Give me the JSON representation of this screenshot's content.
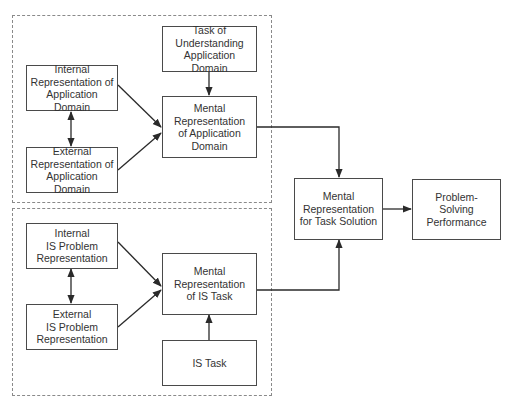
{
  "diagram": {
    "groups": {
      "application_domain": {
        "label": "Application domain group"
      },
      "is_task": {
        "label": "IS task group"
      }
    },
    "nodes": {
      "task_understanding": {
        "label": "Task of\nUnderstanding\nApplication Domain"
      },
      "internal_app_domain": {
        "label": "Internal\nRepresentation of\nApplication Domain"
      },
      "external_app_domain": {
        "label": "External\nRepresentation of\nApplication Domain"
      },
      "mental_app_domain": {
        "label": "Mental\nRepresentation\nof Application\nDomain"
      },
      "internal_is_problem": {
        "label": "Internal\nIS Problem\nRepresentation"
      },
      "external_is_problem": {
        "label": "External\nIS Problem\nRepresentation"
      },
      "mental_is_task": {
        "label": "Mental\nRepresentation\nof IS Task"
      },
      "is_task": {
        "label": "IS Task"
      },
      "mental_task_solution": {
        "label": "Mental\nRepresentation\nfor Task Solution"
      },
      "problem_solving_performance": {
        "label": "Problem-\nSolving\nPerformance"
      }
    },
    "edges": [
      {
        "from": "task_understanding",
        "to": "mental_app_domain",
        "type": "arrow"
      },
      {
        "from": "internal_app_domain",
        "to": "external_app_domain",
        "type": "bidirectional"
      },
      {
        "from": "internal_app_domain",
        "to": "mental_app_domain",
        "type": "arrow"
      },
      {
        "from": "external_app_domain",
        "to": "mental_app_domain",
        "type": "arrow"
      },
      {
        "from": "mental_app_domain",
        "to": "mental_task_solution",
        "type": "arrow"
      },
      {
        "from": "internal_is_problem",
        "to": "external_is_problem",
        "type": "bidirectional"
      },
      {
        "from": "internal_is_problem",
        "to": "mental_is_task",
        "type": "arrow"
      },
      {
        "from": "external_is_problem",
        "to": "mental_is_task",
        "type": "arrow"
      },
      {
        "from": "is_task",
        "to": "mental_is_task",
        "type": "arrow"
      },
      {
        "from": "mental_is_task",
        "to": "mental_task_solution",
        "type": "arrow"
      },
      {
        "from": "mental_task_solution",
        "to": "problem_solving_performance",
        "type": "arrow"
      }
    ],
    "colors": {
      "box_border": "#4a4a4a",
      "group_border": "#8a8a8a",
      "arrow": "#2a2a2a",
      "text": "#333333"
    }
  }
}
